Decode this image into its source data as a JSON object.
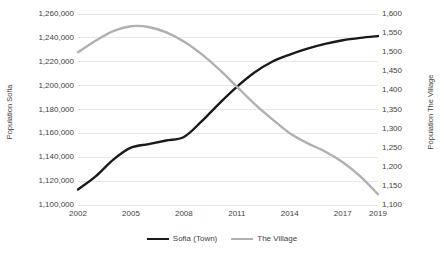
{
  "chart_data": {
    "type": "line",
    "title": "",
    "xlabel": "",
    "grid": true,
    "legend_position": "bottom",
    "x": [
      2002,
      2003,
      2004,
      2005,
      2006,
      2007,
      2008,
      2009,
      2010,
      2011,
      2012,
      2013,
      2014,
      2015,
      2016,
      2017,
      2018,
      2019
    ],
    "x_tick_labels": [
      "2002",
      "2005",
      "2008",
      "2011",
      "2014",
      "2017",
      "2019"
    ],
    "x_ticks": [
      2002,
      2005,
      2008,
      2011,
      2014,
      2017,
      2019
    ],
    "axes": [
      {
        "id": "left",
        "label": "Population Sofia",
        "ylim": [
          1100000,
          1260000
        ],
        "tick_step": 20000,
        "tick_labels": [
          "1,260,000",
          "1,240,000",
          "1,220,000",
          "1,200,000",
          "1,180,000",
          "1,160,000",
          "1,140,000",
          "1,120,000",
          "1,100,000"
        ],
        "tick_values": [
          1260000,
          1240000,
          1220000,
          1200000,
          1180000,
          1160000,
          1140000,
          1120000,
          1100000
        ]
      },
      {
        "id": "right",
        "label": "Population The Village",
        "ylim": [
          1100,
          1600
        ],
        "tick_step": 50,
        "tick_labels": [
          "1,600",
          "1,550",
          "1,500",
          "1,450",
          "1,400",
          "1,350",
          "1,300",
          "1,250",
          "1,200",
          "1,150",
          "1,100"
        ],
        "tick_values": [
          1600,
          1550,
          1500,
          1450,
          1400,
          1350,
          1300,
          1250,
          1200,
          1150,
          1100
        ]
      }
    ],
    "series": [
      {
        "name": "Sofia (Town)",
        "axis": "left",
        "color": "#1a1a1a",
        "width": 2.4,
        "values": [
          1113000,
          1124000,
          1138000,
          1148000,
          1151000,
          1154000,
          1157000,
          1170000,
          1185000,
          1199000,
          1211000,
          1220000,
          1226000,
          1231000,
          1235000,
          1238000,
          1240000,
          1241500
        ]
      },
      {
        "name": "The Village",
        "axis": "right",
        "color": "#b0b0b0",
        "width": 2.4,
        "values": [
          1500,
          1530,
          1555,
          1568,
          1566,
          1552,
          1528,
          1495,
          1455,
          1410,
          1365,
          1325,
          1288,
          1262,
          1240,
          1212,
          1175,
          1128
        ]
      }
    ]
  },
  "legend": {
    "items": [
      {
        "label": "Sofia (Town)",
        "color": "#1a1a1a",
        "width": 2.4
      },
      {
        "label": "The Village",
        "color": "#b0b0b0",
        "width": 2.2
      }
    ]
  }
}
